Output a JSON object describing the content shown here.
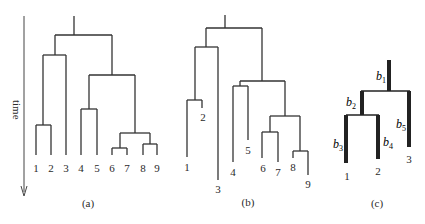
{
  "axis": {
    "label": "time"
  },
  "panels": {
    "a": {
      "caption": "(a)",
      "leaves": [
        "1",
        "2",
        "3",
        "4",
        "5",
        "6",
        "7",
        "8",
        "9"
      ]
    },
    "b": {
      "caption": "(b)",
      "leaves": [
        "1",
        "2",
        "3",
        "4",
        "5",
        "6",
        "7",
        "8",
        "9"
      ]
    },
    "c": {
      "caption": "(c)",
      "leaves": [
        "1",
        "2",
        "3"
      ],
      "branches": [
        "b1",
        "b2",
        "b3",
        "b4",
        "b5"
      ]
    }
  }
}
